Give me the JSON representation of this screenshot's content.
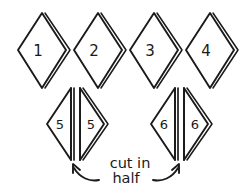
{
  "figure": {
    "kind": "hand-drawn-craft-diagram",
    "background_color": "#ffffff",
    "ink_color": "#1a1a1a",
    "width": 250,
    "height": 190
  },
  "top_row": {
    "label": "whole-diamond-row",
    "pieces": [
      {
        "number": "1",
        "cx": 42,
        "cy": 50
      },
      {
        "number": "2",
        "cx": 98,
        "cy": 50
      },
      {
        "number": "3",
        "cx": 154,
        "cy": 50
      },
      {
        "number": "4",
        "cx": 210,
        "cy": 50
      }
    ]
  },
  "bottom_row": {
    "label": "split-diamond-row",
    "pieces": [
      {
        "number": "5",
        "cx": 76,
        "cy": 124,
        "left_label": "5",
        "right_label": "5"
      },
      {
        "number": "6",
        "cx": 180,
        "cy": 124,
        "left_label": "6",
        "right_label": "6"
      }
    ]
  },
  "annotation": {
    "line1": "cut in",
    "line2": "half",
    "arrows": [
      {
        "name": "left-arrow",
        "points_to": "cut-line-of-diamond-5"
      },
      {
        "name": "right-arrow",
        "points_to": "cut-line-of-diamond-6"
      }
    ]
  }
}
